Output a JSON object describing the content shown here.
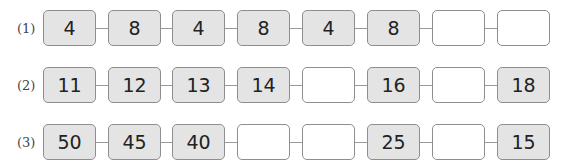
{
  "rows": [
    {
      "label": "(1)",
      "cells": [
        "4",
        "8",
        "4",
        "8",
        "4",
        "8",
        "",
        ""
      ]
    },
    {
      "label": "(2)",
      "cells": [
        "11",
        "12",
        "13",
        "14",
        "",
        "16",
        "",
        "18"
      ]
    },
    {
      "label": "(3)",
      "cells": [
        "50",
        "45",
        "40",
        "",
        "",
        "25",
        "",
        "15"
      ]
    }
  ],
  "colors": {
    "filled_box": "#e4e4e4",
    "empty_box": "#ffffff",
    "border": "#8e8e8e"
  }
}
